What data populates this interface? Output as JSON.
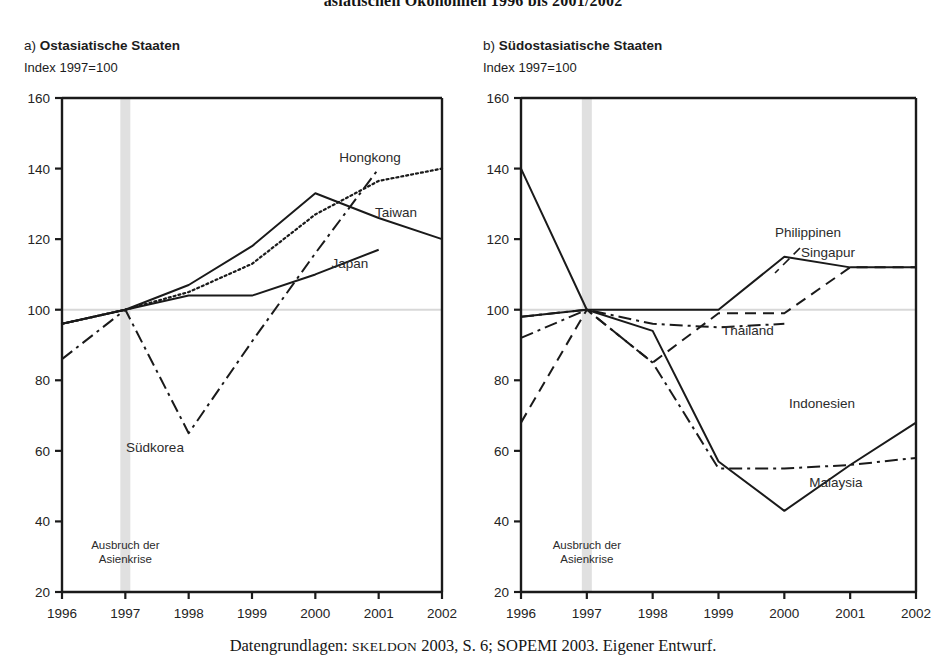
{
  "figure": {
    "title": "asiatischen Ökonomien 1996 bis 2001/2002",
    "caption_prefix": "Datengrundlagen: ",
    "caption_smallcaps": "Skeldon",
    "caption_rest": " 2003, S. 6; SOPEMI 2003. Eigener Entwurf.",
    "crisis_note_line1": "Ausbruch der",
    "crisis_note_line2": "Asienkrise",
    "band_color": "#e0e0e0",
    "baseline_color": "#d8d8d8",
    "line_color": "#1a1a1a"
  },
  "panels": [
    {
      "id": "a",
      "letter": "a)",
      "title": "Ostasiatische Staaten",
      "subtitle": "Index 1997=100"
    },
    {
      "id": "b",
      "letter": "b)",
      "title": "Südostasiatische Staaten",
      "subtitle": "Index 1997=100"
    }
  ],
  "chart_data": [
    {
      "type": "line",
      "title": "a) Ostasiatische Staaten",
      "subtitle": "Index 1997=100",
      "xlabel": "",
      "ylabel": "Index 1997=100",
      "x": [
        1996,
        1997,
        1998,
        1999,
        2000,
        2001,
        2002
      ],
      "xtick_labels": [
        "1996",
        "1997",
        "1998",
        "1999",
        "2000",
        "2001",
        "2002"
      ],
      "ylim": [
        20,
        160
      ],
      "ytick_labels": [
        "20",
        "40",
        "60",
        "80",
        "100",
        "120",
        "140",
        "160"
      ],
      "yticks": [
        20,
        40,
        60,
        80,
        100,
        120,
        140,
        160
      ],
      "grid": false,
      "legend": "inline-labels",
      "reference_line": 100,
      "highlight_band": {
        "at": 1997,
        "label": "Ausbruch der Asienkrise"
      },
      "series": [
        {
          "name": "Hongkong",
          "style": "dotted",
          "label_x": 2001,
          "values": [
            96,
            100,
            105,
            113,
            127,
            136.5,
            140
          ],
          "x": [
            1996,
            1997,
            1998,
            1999,
            2000,
            2001,
            2002
          ]
        },
        {
          "name": "Taiwan",
          "style": "solid",
          "label_x": 2001,
          "values": [
            96,
            100,
            107,
            118,
            133,
            126,
            120
          ],
          "x": [
            1996,
            1997,
            1998,
            1999,
            2000,
            2001,
            2002
          ]
        },
        {
          "name": "Japan",
          "style": "solid",
          "label_x": 2000,
          "values": [
            96,
            100,
            104,
            104,
            110,
            117,
            null
          ],
          "x": [
            1996,
            1997,
            1998,
            1999,
            2000,
            2001,
            2002
          ]
        },
        {
          "name": "Südkorea",
          "style": "dash-dot",
          "label_x": 1998,
          "values": [
            86,
            100,
            65,
            91,
            116,
            140,
            null
          ],
          "x": [
            1996,
            1997,
            1998,
            1999,
            2000,
            2001,
            2002
          ]
        }
      ]
    },
    {
      "type": "line",
      "title": "b) Südostasiatische Staaten",
      "subtitle": "Index 1997=100",
      "xlabel": "",
      "ylabel": "Index 1997=100",
      "x": [
        1996,
        1997,
        1998,
        1999,
        2000,
        2001,
        2002
      ],
      "xtick_labels": [
        "1996",
        "1997",
        "1998",
        "1999",
        "2000",
        "2001",
        "2002"
      ],
      "ylim": [
        20,
        160
      ],
      "ytick_labels": [
        "20",
        "40",
        "60",
        "80",
        "100",
        "120",
        "140",
        "160"
      ],
      "yticks": [
        20,
        40,
        60,
        80,
        100,
        120,
        140,
        160
      ],
      "grid": false,
      "legend": "inline-labels",
      "reference_line": 100,
      "highlight_band": {
        "at": 1997,
        "label": "Ausbruch der Asienkrise"
      },
      "series": [
        {
          "name": "Singapur",
          "style": "solid",
          "label_x": 2001,
          "values": [
            98,
            100,
            100,
            100,
            115,
            112,
            112
          ],
          "x": [
            1996,
            1997,
            1998,
            1999,
            2000,
            2001,
            2002
          ]
        },
        {
          "name": "Philippinen",
          "style": "dashed",
          "label_x": 2000,
          "values": [
            68,
            100,
            85,
            99,
            99,
            112,
            112
          ],
          "x": [
            1996,
            1997,
            1998,
            1999,
            2000,
            2001,
            2002
          ]
        },
        {
          "name": "Thailand",
          "style": "dash-dot",
          "label_x": 1999,
          "values": [
            92,
            100,
            96,
            95,
            96,
            null,
            null
          ],
          "x": [
            1996,
            1997,
            1998,
            1999,
            2000,
            2001,
            2002
          ]
        },
        {
          "name": "Indonesien",
          "style": "solid",
          "label_x": 2001,
          "values": [
            140,
            100,
            94,
            57,
            43,
            56,
            68
          ],
          "x": [
            1996,
            1997,
            1998,
            1999,
            2000,
            2001,
            2002
          ]
        },
        {
          "name": "Malaysia",
          "style": "dash-dot",
          "label_x": 2001,
          "values": [
            98,
            100,
            85,
            55,
            55,
            56,
            58
          ],
          "x": [
            1996,
            1997,
            1998,
            1999,
            2000,
            2001,
            2002
          ]
        }
      ]
    }
  ]
}
